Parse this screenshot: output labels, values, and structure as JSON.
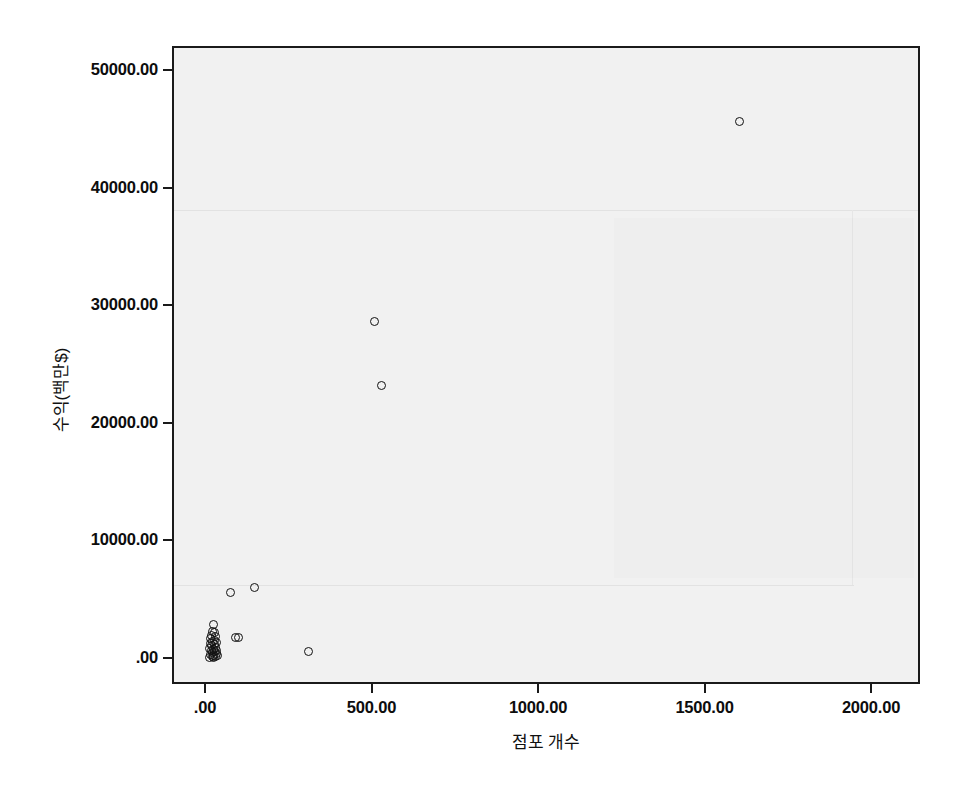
{
  "chart_data": {
    "type": "scatter",
    "title": "",
    "xlabel": "점포 개수",
    "ylabel": "수익(백만$)",
    "xlim": [
      -100,
      2150
    ],
    "ylim": [
      -2200,
      54500
    ],
    "grid": false,
    "legend": null,
    "marker": "open-circle",
    "marker_color": "#111111",
    "xticks": [
      0,
      500,
      1000,
      1500,
      2000
    ],
    "xticklabels": [
      ".00",
      "500.00",
      "1000.00",
      "1500.00",
      "2000.00"
    ],
    "yticks": [
      0,
      10000,
      20000,
      30000,
      40000,
      50000
    ],
    "yticklabels": [
      ".00",
      "10000.00",
      "20000.00",
      "30000.00",
      "40000.00",
      "50000.00"
    ],
    "points": [
      {
        "x": 1600,
        "y": 45800
      },
      {
        "x": 502,
        "y": 28800
      },
      {
        "x": 523,
        "y": 23300
      },
      {
        "x": 144,
        "y": 6200
      },
      {
        "x": 70,
        "y": 5700
      },
      {
        "x": 305,
        "y": 700
      },
      {
        "x": 96,
        "y": 1900
      },
      {
        "x": 86,
        "y": 1900
      },
      {
        "x": 20,
        "y": 3000
      },
      {
        "x": 17,
        "y": 2400
      },
      {
        "x": 22,
        "y": 2300
      },
      {
        "x": 14,
        "y": 2100
      },
      {
        "x": 26,
        "y": 2000
      },
      {
        "x": 12,
        "y": 1800
      },
      {
        "x": 24,
        "y": 1700
      },
      {
        "x": 18,
        "y": 1600
      },
      {
        "x": 28,
        "y": 1500
      },
      {
        "x": 10,
        "y": 1400
      },
      {
        "x": 22,
        "y": 1300
      },
      {
        "x": 15,
        "y": 1200
      },
      {
        "x": 27,
        "y": 1100
      },
      {
        "x": 9,
        "y": 1000
      },
      {
        "x": 20,
        "y": 900
      },
      {
        "x": 30,
        "y": 850
      },
      {
        "x": 13,
        "y": 800
      },
      {
        "x": 24,
        "y": 700
      },
      {
        "x": 17,
        "y": 600
      },
      {
        "x": 28,
        "y": 550
      },
      {
        "x": 11,
        "y": 500
      },
      {
        "x": 21,
        "y": 420
      },
      {
        "x": 32,
        "y": 380
      },
      {
        "x": 16,
        "y": 330
      },
      {
        "x": 25,
        "y": 280
      },
      {
        "x": 8,
        "y": 240
      },
      {
        "x": 19,
        "y": 200
      }
    ]
  },
  "axes": {
    "x_title": "점포 개수",
    "y_title": "수익(백만$)"
  }
}
